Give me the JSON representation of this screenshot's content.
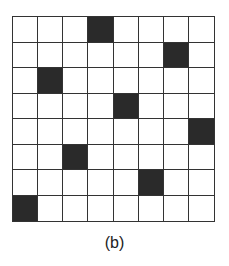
{
  "diagram": {
    "rows": 8,
    "cols": 8,
    "filled_cells": [
      {
        "row": 0,
        "col": 3
      },
      {
        "row": 1,
        "col": 6
      },
      {
        "row": 2,
        "col": 1
      },
      {
        "row": 3,
        "col": 4
      },
      {
        "row": 4,
        "col": 7
      },
      {
        "row": 5,
        "col": 2
      },
      {
        "row": 6,
        "col": 5
      },
      {
        "row": 7,
        "col": 0
      }
    ],
    "fill_color": "#2a2a2a",
    "empty_color": "#ffffff",
    "line_color": "#333333"
  },
  "caption": "(b)"
}
